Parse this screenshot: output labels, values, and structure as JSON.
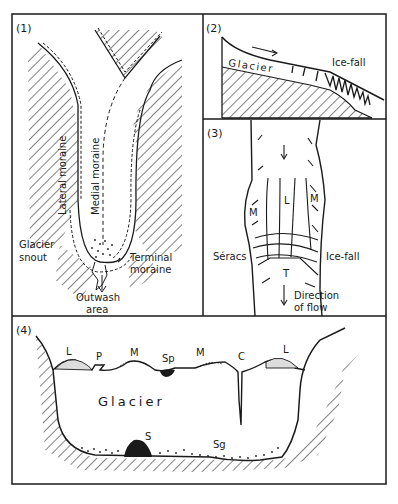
{
  "figure": {
    "panels": [
      {
        "id": "1",
        "number_label": "(1)",
        "labels": {
          "lateral_moraine": "Lateral moraine",
          "medial_moraine": "Medial moraine",
          "glacier_snout_line1": "Glacier",
          "glacier_snout_line2": "snout",
          "terminal_moraine_line1": "Terminal",
          "terminal_moraine_line2": "moraine",
          "outwash_line1": "Outwash",
          "outwash_line2": "area"
        }
      },
      {
        "id": "2",
        "number_label": "(2)",
        "labels": {
          "glacier": "Glacier",
          "icefall": "Ice-fall"
        },
        "icons": [
          "flow-arrow-icon"
        ]
      },
      {
        "id": "3",
        "number_label": "(3)",
        "labels": {
          "L": "L",
          "M_left": "M",
          "M_right": "M",
          "T": "T",
          "seracs": "Sérács",
          "icefall": "Ice-fall",
          "direction_line1": "Direction",
          "direction_line2": "of flow"
        },
        "icons": [
          "down-arrow-icon",
          "down-arrow-icon"
        ]
      },
      {
        "id": "4",
        "number_label": "(4)",
        "labels": {
          "L_left": "L",
          "P": "P",
          "M_left": "M",
          "Sp": "Sp",
          "M_right": "M",
          "C": "C",
          "L_right": "L",
          "glacier": "Glacier",
          "S": "S",
          "Sg": "Sg"
        }
      }
    ]
  }
}
